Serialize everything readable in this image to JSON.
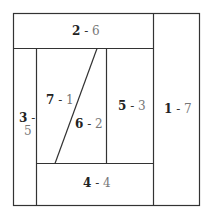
{
  "diagram": {
    "type": "rectangle-partition",
    "regions": [
      {
        "id": "2-6",
        "first": "2",
        "sep": " - ",
        "second": "6"
      },
      {
        "id": "1-7",
        "first": "1",
        "sep": " - ",
        "second": "7"
      },
      {
        "id": "3-5",
        "first": "3",
        "sep": " -",
        "second": "5"
      },
      {
        "id": "7-1",
        "first": "7",
        "sep": " - ",
        "second": "1"
      },
      {
        "id": "6-2",
        "first": "6",
        "sep": " - ",
        "second": "2"
      },
      {
        "id": "5-3",
        "first": "5",
        "sep": " - ",
        "second": "3"
      },
      {
        "id": "4-4",
        "first": "4",
        "sep": " - ",
        "second": "4"
      }
    ],
    "line_color": "#333333"
  }
}
